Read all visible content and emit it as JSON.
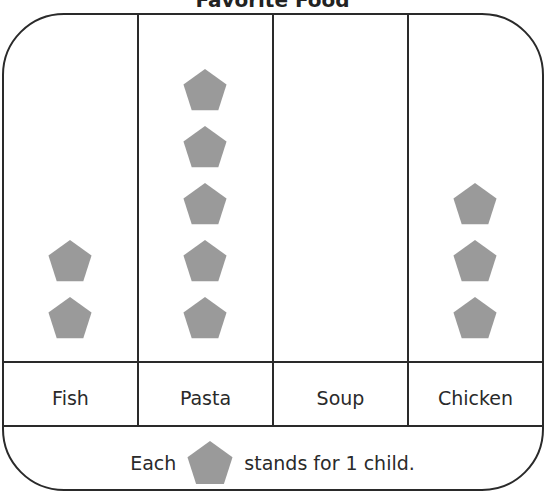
{
  "chart_data": {
    "type": "pictograph",
    "title": "Favorite Food",
    "categories": [
      "Fish",
      "Pasta",
      "Soup",
      "Chicken"
    ],
    "values": [
      2,
      5,
      0,
      3
    ],
    "symbol": "pentagon",
    "symbol_color": "#9a9a9a",
    "key": "Each pentagon stands for 1 child.",
    "unit_value": 1
  },
  "title": "Favorite Food",
  "columns": [
    {
      "label": "Fish",
      "count": 2
    },
    {
      "label": "Pasta",
      "count": 5
    },
    {
      "label": "Soup",
      "count": 0
    },
    {
      "label": "Chicken",
      "count": 3
    }
  ],
  "legend": {
    "prefix": "Each",
    "suffix": "stands for 1 child."
  },
  "colors": {
    "symbol": "#9a9a9a",
    "line": "#2a2a2a"
  }
}
